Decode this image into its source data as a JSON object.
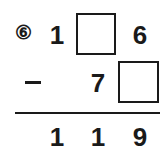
{
  "problem": {
    "number": "⑥",
    "minuend": {
      "d1": "1",
      "d2_blank": "",
      "d3": "6"
    },
    "operator": "−",
    "subtrahend": {
      "d1": "7",
      "d2_blank": ""
    },
    "result": {
      "d1": "1",
      "d2": "1",
      "d3": "9"
    }
  }
}
